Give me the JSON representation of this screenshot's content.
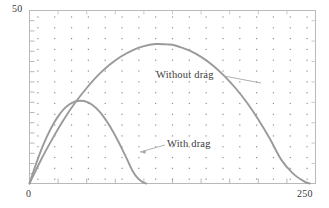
{
  "chart_data": {
    "type": "line",
    "title": "",
    "xlabel": "",
    "ylabel": "",
    "xlim": [
      0,
      250
    ],
    "ylim": [
      0,
      50
    ],
    "grid": "dots",
    "legend_position": "inline-annotations",
    "axis_labels": {
      "y_max": "50",
      "x_min": "0",
      "x_max": "250"
    },
    "annotations": [
      {
        "text": "Without drag",
        "x": 140,
        "y": 28
      },
      {
        "text": "With drag",
        "x": 120,
        "y": 13
      }
    ],
    "series": [
      {
        "name": "Without drag",
        "color": "#9a9a9a",
        "x": [
          0,
          10,
          20,
          30,
          40,
          50,
          60,
          70,
          80,
          90,
          100,
          110,
          120,
          125,
          130,
          140,
          150,
          160,
          170,
          180,
          190,
          200,
          210,
          220,
          230,
          240,
          245
        ],
        "y": [
          0,
          6.8,
          12.9,
          18.5,
          23.4,
          27.6,
          31.3,
          34.3,
          36.7,
          38.5,
          39.7,
          40.3,
          40.2,
          40.1,
          39.6,
          38.4,
          36.6,
          34.2,
          31.2,
          27.6,
          23.4,
          18.5,
          13.0,
          6.9,
          3.0,
          0.6,
          0
        ]
      },
      {
        "name": "With drag",
        "color": "#9a9a9a",
        "x": [
          0,
          5,
          10,
          15,
          20,
          25,
          30,
          35,
          40,
          45,
          50,
          55,
          60,
          65,
          70,
          75,
          80,
          85,
          90,
          95,
          100,
          102
        ],
        "y": [
          0,
          5.0,
          9.5,
          13.4,
          16.7,
          19.4,
          21.5,
          22.9,
          23.7,
          23.9,
          23.6,
          22.7,
          21.2,
          19.2,
          16.7,
          13.8,
          10.6,
          7.2,
          3.7,
          1.4,
          0.2,
          0
        ]
      }
    ],
    "ticks": {
      "x_count": 10,
      "y_count": 17
    }
  },
  "figure": {
    "background": "#ffffff",
    "frame_color": "#b9b9b9",
    "grid_dot_color": "#8e8e8e",
    "curve_color": "#9a9a9a",
    "leader_line_color": "#a8a8a8"
  }
}
